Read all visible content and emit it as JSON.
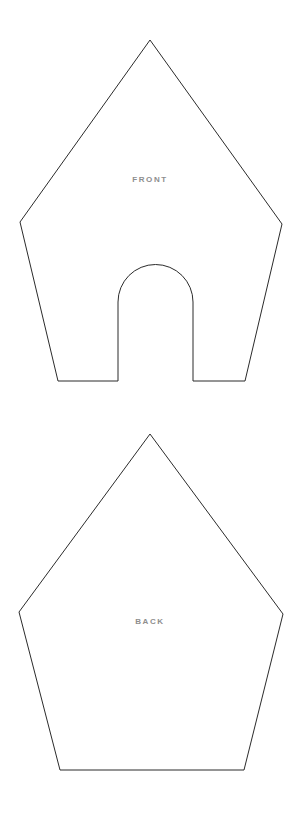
{
  "page": {
    "background_color": "#ffffff",
    "width": 302,
    "height": 813
  },
  "style": {
    "outline_color": "#2b2b2b",
    "outline_width": 1,
    "fill_color": "#ffffff",
    "label_color": "#8e8e8e",
    "label_font_size": 8,
    "label_letter_spacing": 1.6
  },
  "pieces": [
    {
      "id": "front",
      "label": "FRONT",
      "shape": "house-pentagon-with-arched-door",
      "label_position": {
        "x": 150,
        "y": 180
      },
      "outline_path": "M 150 40 L 282 224 L 245 381 L 193 381 L 193 302 A 37.5 37.5 0 0 0 118 302 L 118 381 L 58 381 L 20 222 Z",
      "geometry": {
        "apex": {
          "x": 150,
          "y": 40
        },
        "right_shoulder": {
          "x": 282,
          "y": 224
        },
        "bottom_right": {
          "x": 245,
          "y": 381
        },
        "bottom_left": {
          "x": 58,
          "y": 381
        },
        "left_shoulder": {
          "x": 20,
          "y": 222
        },
        "door": {
          "left": 118,
          "right": 193,
          "arch_top_y": 265,
          "arch_radius": 37.5,
          "spring_line_y": 302,
          "bottom_y": 381
        }
      }
    },
    {
      "id": "back",
      "label": "BACK",
      "shape": "pentagon",
      "label_position": {
        "x": 150,
        "y": 622
      },
      "outline_path": "M 150 434 L 283 614 L 244 770 L 60 770 L 19 612 Z",
      "geometry": {
        "apex": {
          "x": 150,
          "y": 434
        },
        "right_shoulder": {
          "x": 283,
          "y": 614
        },
        "bottom_right": {
          "x": 244,
          "y": 770
        },
        "bottom_left": {
          "x": 60,
          "y": 770
        },
        "left_shoulder": {
          "x": 19,
          "y": 612
        }
      }
    }
  ]
}
